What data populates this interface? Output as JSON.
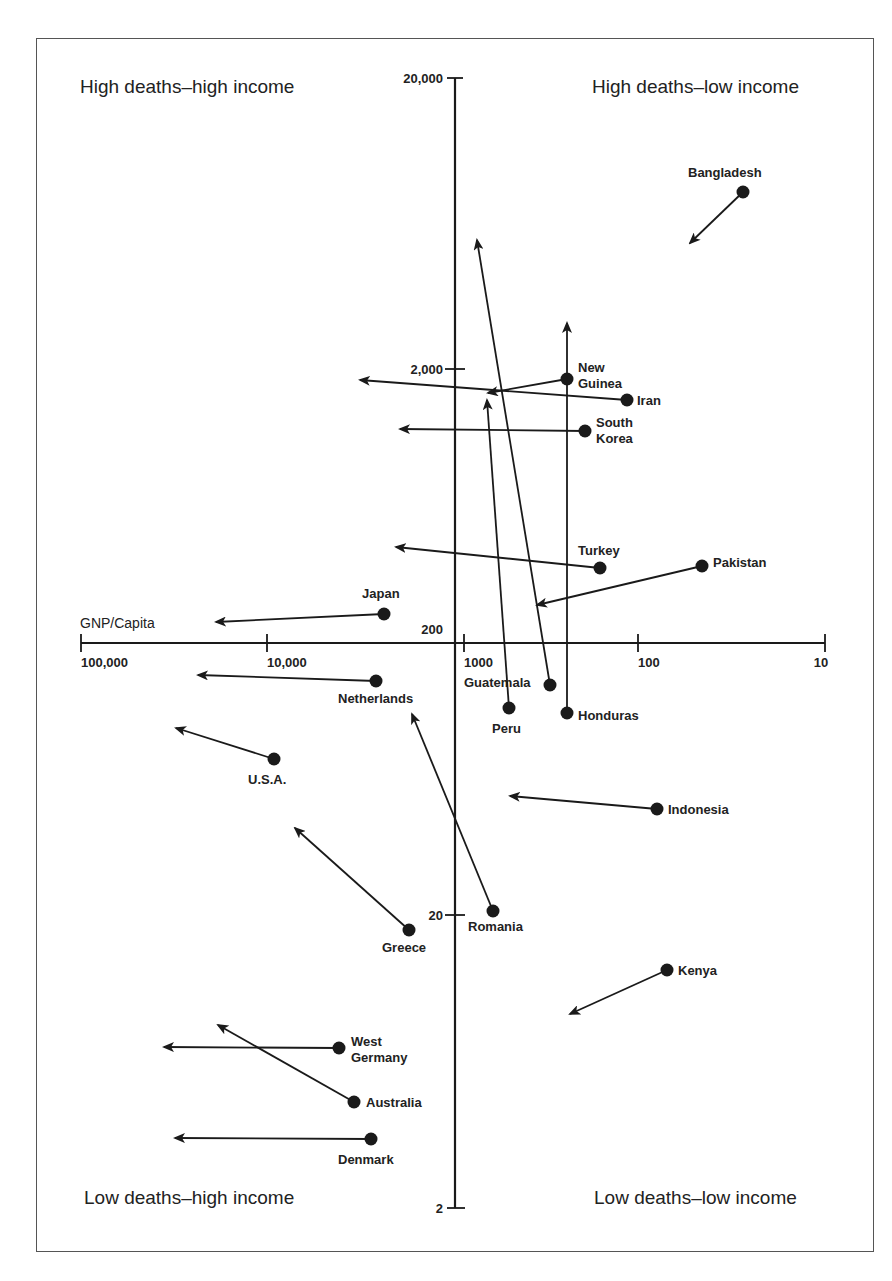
{
  "chart_data": {
    "type": "scatter",
    "subtype": "arrow-plot",
    "title": "",
    "xlabel": "GNP/Capita",
    "ylabel": "Deaths",
    "x_scale": "log",
    "x_reversed": true,
    "y_scale": "log",
    "x_ticks": [
      "100,000",
      "10,000",
      "1000",
      "100",
      "10"
    ],
    "y_ticks": [
      "20,000",
      "2,000",
      "200",
      "20",
      "2"
    ],
    "xlim": [
      100000,
      10
    ],
    "ylim": [
      2,
      20000
    ],
    "grid": false,
    "legend": null,
    "quadrant_labels": {
      "top_left": "High deaths–high income",
      "top_right": "High deaths–low income",
      "bottom_left": "Low deaths–high income",
      "bottom_right": "Low deaths–low income"
    },
    "series": [
      {
        "name": "Bangladesh",
        "start": {
          "gnp": 30,
          "deaths": 8500
        },
        "end": {
          "gnp": 55,
          "deaths": 5500
        }
      },
      {
        "name": "New Guinea",
        "start": {
          "gnp": 190,
          "deaths": 1800
        },
        "end": {
          "gnp": 490,
          "deaths": 1600
        }
      },
      {
        "name": "Iran",
        "start": {
          "gnp": 90,
          "deaths": 1500
        },
        "end": {
          "gnp": 2400,
          "deaths": 1800
        }
      },
      {
        "name": "South Korea",
        "start": {
          "gnp": 150,
          "deaths": 1200
        },
        "end": {
          "gnp": 1470,
          "deaths": 1200
        }
      },
      {
        "name": "Turkey",
        "start": {
          "gnp": 125,
          "deaths": 400
        },
        "end": {
          "gnp": 1550,
          "deaths": 480
        }
      },
      {
        "name": "Pakistan",
        "start": {
          "gnp": 35,
          "deaths": 400
        },
        "end": {
          "gnp": 270,
          "deaths": 300
        }
      },
      {
        "name": "Japan",
        "start": {
          "gnp": 2700,
          "deaths": 250
        },
        "end": {
          "gnp": 21000,
          "deaths": 235
        }
      },
      {
        "name": "Netherlands",
        "start": {
          "gnp": 3000,
          "deaths": 145
        },
        "end": {
          "gnp": 26000,
          "deaths": 150
        }
      },
      {
        "name": "Guatemala",
        "start": {
          "gnp": 240,
          "deaths": 140
        },
        "end": {
          "gnp": 600,
          "deaths": 5000
        }
      },
      {
        "name": "Peru",
        "start": {
          "gnp": 400,
          "deaths": 115
        },
        "end": {
          "gnp": 530,
          "deaths": 1650
        }
      },
      {
        "name": "Honduras",
        "start": {
          "gnp": 190,
          "deaths": 110
        },
        "end": {
          "gnp": 190,
          "deaths": 2600
        }
      },
      {
        "name": "U.S.A.",
        "start": {
          "gnp": 9000,
          "deaths": 75
        },
        "end": {
          "gnp": 30000,
          "deaths": 95
        }
      },
      {
        "name": "Indonesia",
        "start": {
          "gnp": 70,
          "deaths": 52
        },
        "end": {
          "gnp": 430,
          "deaths": 57
        }
      },
      {
        "name": "Greece",
        "start": {
          "gnp": 2000,
          "deaths": 18
        },
        "end": {
          "gnp": 8300,
          "deaths": 40
        }
      },
      {
        "name": "Romania",
        "start": {
          "gnp": 700,
          "deaths": 21
        },
        "end": {
          "gnp": 1900,
          "deaths": 105
        }
      },
      {
        "name": "Kenya",
        "start": {
          "gnp": 62,
          "deaths": 13
        },
        "end": {
          "gnp": 210,
          "deaths": 9.5
        }
      },
      {
        "name": "West Germany",
        "start": {
          "gnp": 3500,
          "deaths": 7
        },
        "end": {
          "gnp": 30000,
          "deaths": 7
        }
      },
      {
        "name": "Australia",
        "start": {
          "gnp": 2900,
          "deaths": 4.6
        },
        "end": {
          "gnp": 15500,
          "deaths": 8.3
        }
      },
      {
        "name": "Denmark",
        "start": {
          "gnp": 2400,
          "deaths": 3.4
        },
        "end": {
          "gnp": 27000,
          "deaths": 3.5
        }
      }
    ]
  },
  "plot": {
    "label_color": "#222222",
    "line_color": "#1a1a1a",
    "points": [
      {
        "name": "Bangladesh",
        "label": "Bangladesh",
        "label2": "",
        "dot": [
          743,
          192
        ],
        "tip": [
          690,
          243
        ],
        "lx": 688,
        "ly": 177,
        "anchor": "start"
      },
      {
        "name": "New Guinea",
        "label": "New",
        "label2": "Guinea",
        "dot": [
          567,
          379
        ],
        "tip": [
          488,
          393
        ],
        "lx": 578,
        "ly": 372,
        "anchor": "start"
      },
      {
        "name": "Iran",
        "label": "Iran",
        "label2": "",
        "dot": [
          627,
          400
        ],
        "tip": [
          360,
          380
        ],
        "lx": 637,
        "ly": 405,
        "anchor": "start"
      },
      {
        "name": "South Korea",
        "label": "South",
        "label2": "Korea",
        "dot": [
          585,
          431
        ],
        "tip": [
          400,
          429
        ],
        "lx": 596,
        "ly": 427,
        "anchor": "start"
      },
      {
        "name": "Turkey",
        "label": "Turkey",
        "label2": "",
        "dot": [
          600,
          568
        ],
        "tip": [
          396,
          547
        ],
        "lx": 578,
        "ly": 555,
        "anchor": "start"
      },
      {
        "name": "Pakistan",
        "label": "Pakistan",
        "label2": "",
        "dot": [
          702,
          566
        ],
        "tip": [
          537,
          605
        ],
        "lx": 713,
        "ly": 567,
        "anchor": "start"
      },
      {
        "name": "Japan",
        "label": "Japan",
        "label2": "",
        "dot": [
          384,
          614
        ],
        "tip": [
          216,
          622
        ],
        "lx": 362,
        "ly": 598,
        "anchor": "start"
      },
      {
        "name": "Netherlands",
        "label": "Netherlands",
        "label2": "",
        "dot": [
          376,
          681
        ],
        "tip": [
          198,
          675
        ],
        "lx": 338,
        "ly": 703,
        "anchor": "start"
      },
      {
        "name": "Guatemala",
        "label": "Guatemala",
        "label2": "",
        "dot": [
          550,
          685
        ],
        "tip": [
          477,
          240
        ],
        "lx": 464,
        "ly": 687,
        "anchor": "start"
      },
      {
        "name": "Peru",
        "label": "Peru",
        "label2": "",
        "dot": [
          509,
          708
        ],
        "tip": [
          487,
          400
        ],
        "lx": 492,
        "ly": 733,
        "anchor": "start"
      },
      {
        "name": "Honduras",
        "label": "Honduras",
        "label2": "",
        "dot": [
          567,
          713
        ],
        "tip": [
          567,
          323
        ],
        "lx": 578,
        "ly": 720,
        "anchor": "start"
      },
      {
        "name": "U.S.A.",
        "label": "U.S.A.",
        "label2": "",
        "dot": [
          274,
          759
        ],
        "tip": [
          176,
          728
        ],
        "lx": 248,
        "ly": 784,
        "anchor": "start"
      },
      {
        "name": "Indonesia",
        "label": "Indonesia",
        "label2": "",
        "dot": [
          657,
          809
        ],
        "tip": [
          510,
          796
        ],
        "lx": 668,
        "ly": 814,
        "anchor": "start"
      },
      {
        "name": "Greece",
        "label": "Greece",
        "label2": "",
        "dot": [
          409,
          930
        ],
        "tip": [
          295,
          828
        ],
        "lx": 382,
        "ly": 952,
        "anchor": "start"
      },
      {
        "name": "Romania",
        "label": "Romania",
        "label2": "",
        "dot": [
          493,
          911
        ],
        "tip": [
          412,
          714
        ],
        "lx": 468,
        "ly": 931,
        "anchor": "start"
      },
      {
        "name": "Kenya",
        "label": "Kenya",
        "label2": "",
        "dot": [
          667,
          970
        ],
        "tip": [
          570,
          1014
        ],
        "lx": 678,
        "ly": 975,
        "anchor": "start"
      },
      {
        "name": "West Germany",
        "label": "West",
        "label2": "Germany",
        "dot": [
          339,
          1048
        ],
        "tip": [
          164,
          1047
        ],
        "lx": 351,
        "ly": 1046,
        "anchor": "start"
      },
      {
        "name": "Australia",
        "label": "Australia",
        "label2": "",
        "dot": [
          354,
          1102
        ],
        "tip": [
          218,
          1025
        ],
        "lx": 366,
        "ly": 1107,
        "anchor": "start"
      },
      {
        "name": "Denmark",
        "label": "Denmark",
        "label2": "",
        "dot": [
          371,
          1139
        ],
        "tip": [
          175,
          1138
        ],
        "lx": 338,
        "ly": 1164,
        "anchor": "start"
      }
    ],
    "x_axis": {
      "y": 643,
      "x_start": 81,
      "x_end": 825,
      "ticks": [
        {
          "x": 81,
          "label": "100,000"
        },
        {
          "x": 267,
          "label": "10,000"
        },
        {
          "x": 464,
          "label": "1000"
        },
        {
          "x": 638,
          "label": "100"
        },
        {
          "x": 825,
          "label": "10"
        }
      ],
      "title": "GNP/Capita"
    },
    "y_axis": {
      "x": 455,
      "y_start": 78,
      "y_end": 1208,
      "ticks": [
        {
          "y": 78,
          "label": "20,000"
        },
        {
          "y": 369,
          "label": "2,000"
        },
        {
          "y": 640,
          "label": "200"
        },
        {
          "y": 915,
          "label": "20"
        },
        {
          "y": 1208,
          "label": "2"
        }
      ]
    }
  }
}
